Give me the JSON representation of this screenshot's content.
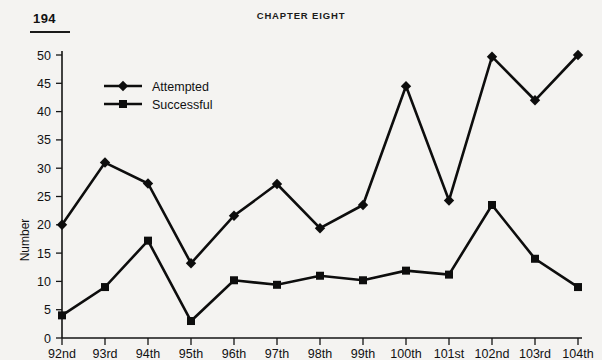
{
  "page": {
    "folio": "194",
    "running_head": "CHAPTER EIGHT"
  },
  "chart_data": {
    "type": "line",
    "title": "",
    "xlabel": "",
    "ylabel": "Number",
    "ylim": [
      0,
      50
    ],
    "ytick_step": 5,
    "yticks": [
      "0",
      "5",
      "10",
      "15",
      "20",
      "25",
      "30",
      "35",
      "40",
      "45",
      "50"
    ],
    "grid": false,
    "legend_position": "upper-left",
    "categories": [
      "92nd",
      "93rd",
      "94th",
      "95th",
      "96th",
      "97th",
      "98th",
      "99th",
      "100th",
      "101st",
      "102nd",
      "103rd",
      "104th"
    ],
    "series": [
      {
        "name": "Attempted",
        "marker": "diamond",
        "values": [
          20,
          31,
          27.3,
          13.2,
          21.6,
          27.2,
          19.4,
          23.5,
          44.5,
          24.3,
          49.7,
          42,
          50
        ]
      },
      {
        "name": "Successful",
        "marker": "square",
        "values": [
          4,
          9,
          17.2,
          3,
          10.2,
          9.4,
          11,
          10.2,
          11.9,
          11.2,
          23.5,
          14,
          9
        ]
      }
    ]
  },
  "colors": {
    "ink": "#0d0d0d",
    "paper": "#f4f3f1"
  }
}
